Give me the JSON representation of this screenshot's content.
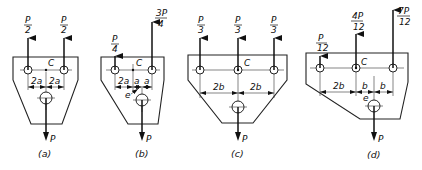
{
  "figure": {
    "panels": [
      {
        "id": "a",
        "caption": "(a)",
        "forces_up": [
          {
            "num": "P",
            "den": "2"
          },
          {
            "num": "P",
            "den": "2"
          }
        ],
        "center_label": "C",
        "dimensions": [
          "2a",
          "2a"
        ],
        "load_label": "P"
      },
      {
        "id": "b",
        "caption": "(b)",
        "forces_up": [
          {
            "num": "P",
            "den": "4"
          },
          {
            "num": "3P",
            "den": "4"
          }
        ],
        "center_label": "C",
        "dimensions": [
          "2a",
          "a",
          "a"
        ],
        "eccentricity_label": "e",
        "load_label": "P"
      },
      {
        "id": "c",
        "caption": "(c)",
        "forces_up": [
          {
            "num": "P",
            "den": "3"
          },
          {
            "num": "P",
            "den": "3"
          },
          {
            "num": "P",
            "den": "3"
          }
        ],
        "center_label": "C",
        "dimensions": [
          "2b",
          "2b"
        ],
        "load_label": "P"
      },
      {
        "id": "d",
        "caption": "(d)",
        "forces_up": [
          {
            "num": "P",
            "den": "12"
          },
          {
            "num": "4P",
            "den": "12"
          },
          {
            "num": "7P",
            "den": "12"
          }
        ],
        "center_label": "C",
        "dimensions": [
          "2b",
          "b",
          "b"
        ],
        "eccentricity_label": "e",
        "load_label": "P"
      }
    ]
  }
}
